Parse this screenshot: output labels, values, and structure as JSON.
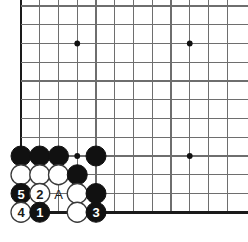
{
  "diagram": {
    "kind": "go-board-problem",
    "board": {
      "cell_size": 18.75,
      "origin_x": 21,
      "origin_y": 6,
      "cols": 12,
      "rows": 12,
      "line_color": "#6e6e6e",
      "edge_color": "#1a1a1a",
      "background": "#ffffff",
      "stone_radius": 10,
      "left_edge_col": 0,
      "bottom_edge_row": 11,
      "visible_right_col": 11,
      "top_cropped": true,
      "right_cropped": true
    },
    "star_points": [
      {
        "col": 3,
        "row": 2
      },
      {
        "col": 9,
        "row": 2
      },
      {
        "col": 9,
        "row": 8
      },
      {
        "col": 3,
        "row": 8
      }
    ],
    "stones": [
      {
        "id": "b-a",
        "color": "black",
        "col": 0,
        "row": 8,
        "label": ""
      },
      {
        "id": "b-b",
        "color": "black",
        "col": 1,
        "row": 8,
        "label": ""
      },
      {
        "id": "b-c",
        "color": "black",
        "col": 2,
        "row": 8,
        "label": ""
      },
      {
        "id": "b-d",
        "color": "black",
        "col": 4,
        "row": 8,
        "label": ""
      },
      {
        "id": "w-a",
        "color": "white",
        "col": 0,
        "row": 9,
        "label": ""
      },
      {
        "id": "w-b",
        "color": "white",
        "col": 1,
        "row": 9,
        "label": ""
      },
      {
        "id": "w-c",
        "color": "white",
        "col": 2,
        "row": 9,
        "label": ""
      },
      {
        "id": "b-e",
        "color": "black",
        "col": 3,
        "row": 9,
        "label": ""
      },
      {
        "id": "move-5",
        "color": "black",
        "col": 0,
        "row": 10,
        "label": "5"
      },
      {
        "id": "move-2",
        "color": "white",
        "col": 1,
        "row": 10,
        "label": "2"
      },
      {
        "id": "w-d",
        "color": "white",
        "col": 3,
        "row": 10,
        "label": ""
      },
      {
        "id": "b-f",
        "color": "black",
        "col": 4,
        "row": 10,
        "label": ""
      },
      {
        "id": "move-4",
        "color": "white",
        "col": 0,
        "row": 11,
        "label": "4"
      },
      {
        "id": "move-1",
        "color": "black",
        "col": 1,
        "row": 11,
        "label": "1"
      },
      {
        "id": "w-e",
        "color": "white",
        "col": 3,
        "row": 11,
        "label": ""
      },
      {
        "id": "move-3",
        "color": "black",
        "col": 4,
        "row": 11,
        "label": "3"
      }
    ],
    "point_labels": [
      {
        "id": "label-A",
        "text": "A",
        "col": 2,
        "row": 10
      }
    ],
    "move_order": [
      "1",
      "2",
      "3",
      "4",
      "5"
    ],
    "legend": {
      "black_label_color": "#ffffff",
      "white_label_color": "#1a1a1a"
    }
  }
}
